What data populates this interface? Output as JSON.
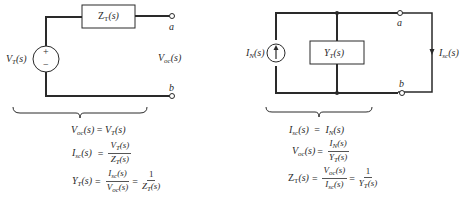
{
  "thevenin": {
    "impedance_label": "Z",
    "impedance_sub": "T",
    "source_label": "V",
    "source_sub": "T",
    "source_plus": "+",
    "source_minus": "−",
    "terminal_a": "a",
    "terminal_b": "b",
    "voltage_label": "V",
    "voltage_sub": "oc",
    "arg": "(s)",
    "equations": {
      "eq1": {
        "lhs": "V",
        "lhs_sub": "oc",
        "rhs": "V",
        "rhs_sub": "T"
      },
      "eq2": {
        "lhs": "I",
        "lhs_sub": "sc",
        "num": "V",
        "num_sub": "T",
        "den": "Z",
        "den_sub": "T"
      },
      "eq3": {
        "lhs": "Y",
        "lhs_sub": "T",
        "num": "I",
        "num_sub": "sc",
        "den": "V",
        "den_sub": "oc",
        "num2": "1",
        "den2": "Z",
        "den2_sub": "T"
      }
    }
  },
  "norton": {
    "admittance_label": "Y",
    "admittance_sub": "T",
    "source_label": "I",
    "source_sub": "N",
    "terminal_a": "a",
    "terminal_b": "b",
    "current_label": "I",
    "current_sub": "sc",
    "arg": "(s)",
    "equations": {
      "eq1": {
        "lhs": "I",
        "lhs_sub": "sc",
        "rhs": "I",
        "rhs_sub": "N"
      },
      "eq2": {
        "lhs": "V",
        "lhs_sub": "oc",
        "num": "I",
        "num_sub": "N",
        "den": "Y",
        "den_sub": "T"
      },
      "eq3": {
        "lhs": "Z",
        "lhs_sub": "T",
        "num": "V",
        "num_sub": "oc",
        "den": "I",
        "den_sub": "sc",
        "num2": "1",
        "den2": "Y",
        "den2_sub": "T"
      }
    }
  },
  "common": {
    "equals": "=",
    "arg": "(s)"
  }
}
